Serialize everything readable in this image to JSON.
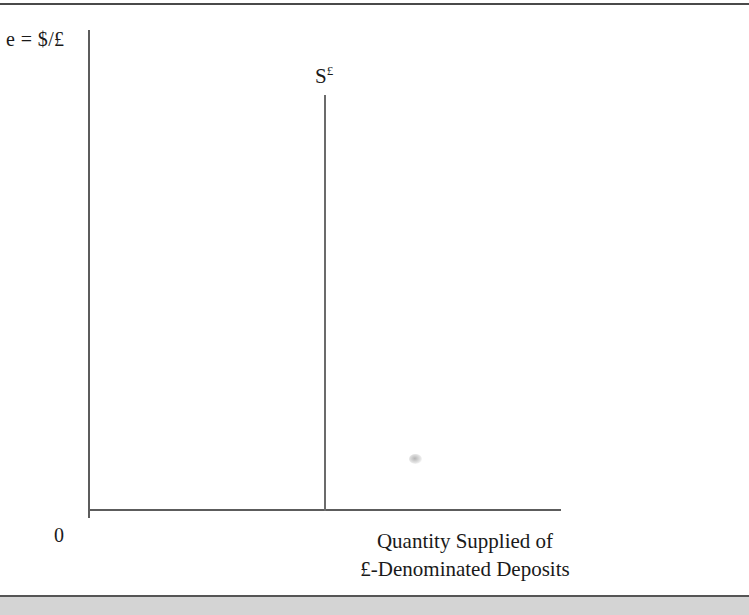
{
  "figure": {
    "y_axis_label": "e = $/£",
    "origin_label": "0",
    "curve_label_base": "S",
    "curve_label_sup": "£",
    "x_axis_label_line1": "Quantity Supplied of",
    "x_axis_label_line2": "£-Denominated Deposits",
    "axis_color": "#5c5c5c",
    "curve_color": "#6b6b6b",
    "rule_color": "#4a4a4a",
    "band_color": "#d4d4d4",
    "background": "#ffffff"
  },
  "chart_data": {
    "type": "line",
    "title": "",
    "subtitle": "",
    "xlabel": "Quantity Supplied of £-Denominated Deposits",
    "ylabel": "e = $/£",
    "grid": false,
    "legend": "none",
    "xlim": [
      0,
      100
    ],
    "ylim": [
      0,
      100
    ],
    "x_tick_labels": [
      "0"
    ],
    "y_tick_labels": [],
    "annotations": [
      {
        "text": "S£",
        "x": 50,
        "y": 86,
        "describes": "vertical supply curve of pound-denominated deposits"
      }
    ],
    "series": [
      {
        "name": "S£",
        "type": "vertical-line",
        "description": "Perfectly inelastic (vertical) supply of £-denominated deposits; quantity fixed regardless of exchange rate",
        "x": [
          50,
          50
        ],
        "y": [
          0,
          86
        ]
      }
    ]
  }
}
